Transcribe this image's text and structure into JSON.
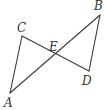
{
  "figure": {
    "points": [
      {
        "id": "A",
        "label": "A"
      },
      {
        "id": "B",
        "label": "B"
      },
      {
        "id": "C",
        "label": "C"
      },
      {
        "id": "D",
        "label": "D"
      },
      {
        "id": "E",
        "label": "E"
      }
    ],
    "segments": [
      {
        "from": "A",
        "to": "B"
      },
      {
        "from": "C",
        "to": "D"
      },
      {
        "from": "A",
        "to": "C"
      },
      {
        "from": "B",
        "to": "D"
      }
    ],
    "colors": {
      "line": "#3a3a3a",
      "label": "#333333"
    }
  }
}
